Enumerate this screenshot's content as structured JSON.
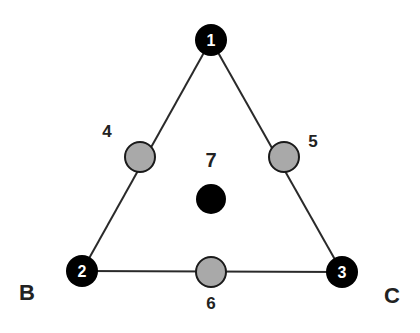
{
  "diagram": {
    "title": "",
    "colors": {
      "edge": "#2a2a2a",
      "vertex_fill": "#000000",
      "vertex_text": "#ffffff",
      "midpoint_fill": "#a9a9a9",
      "midpoint_stroke": "#1a1a1a",
      "label_text": "#222222"
    },
    "vertices": [
      {
        "id": "1",
        "label": "1"
      },
      {
        "id": "2",
        "label": "2"
      },
      {
        "id": "3",
        "label": "3"
      }
    ],
    "midpoints": [
      {
        "id": "4",
        "label": "4",
        "between": [
          "1",
          "2"
        ]
      },
      {
        "id": "5",
        "label": "5",
        "between": [
          "1",
          "3"
        ]
      },
      {
        "id": "6",
        "label": "6",
        "between": [
          "2",
          "3"
        ]
      }
    ],
    "centroid": {
      "id": "7",
      "label": "7"
    },
    "corner_labels": {
      "B": "B",
      "C": "C"
    },
    "edges": [
      [
        "1",
        "2"
      ],
      [
        "1",
        "3"
      ],
      [
        "2",
        "3"
      ]
    ]
  }
}
